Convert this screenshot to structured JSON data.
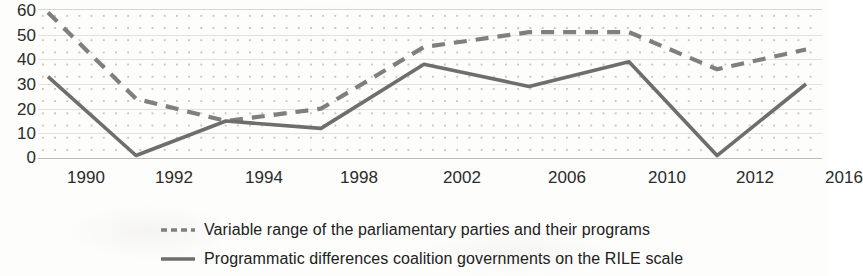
{
  "chart_data": {
    "type": "line",
    "title": "",
    "subtitle": "",
    "xlabel": "",
    "ylabel": "",
    "categories": [
      "1990",
      "1992",
      "1994",
      "1998",
      "2002",
      "2006",
      "2010",
      "2012",
      "2016"
    ],
    "x": [
      1990,
      1992,
      1994,
      1998,
      2002,
      2006,
      2010,
      2012,
      2016
    ],
    "ylim": [
      0,
      60
    ],
    "xlim_index": [
      0,
      8
    ],
    "y_ticks": [
      0,
      10,
      20,
      30,
      40,
      50,
      60
    ],
    "grid": "horizontal-light-with-dot-pattern-background",
    "legend_position": "bottom-center",
    "series": [
      {
        "name": "Variable range of the parliamentary parties and their programs",
        "style": "dashed",
        "color": "#7f7f7f",
        "values": [
          59,
          24,
          15,
          20,
          45,
          51,
          51,
          36,
          44
        ]
      },
      {
        "name": "Programmatic differences coalition governments on the RILE scale",
        "style": "solid",
        "color": "#6e6e6e",
        "values": [
          33,
          1,
          15,
          12,
          38,
          29,
          39,
          1,
          30
        ]
      }
    ]
  },
  "axes": {
    "y_tick_labels": [
      "60",
      "50",
      "40",
      "30",
      "20",
      "10",
      "0"
    ],
    "x_tick_labels": [
      "1990",
      "1992",
      "1994",
      "1998",
      "2002",
      "2006",
      "2010",
      "2012",
      "2016"
    ]
  },
  "legend": {
    "entries": [
      {
        "label": "Variable range of the parliamentary parties and their programs",
        "marker": "dashed-line-swatch",
        "color": "#7f7f7f"
      },
      {
        "label": "Programmatic differences coalition governments on the RILE scale",
        "marker": "solid-line-swatch",
        "color": "#6e6e6e"
      }
    ]
  },
  "colors": {
    "series_dashed": "#7f7f7f",
    "series_solid": "#6e6e6e",
    "text": "#2b2b2b",
    "grid": "#e3e1dd",
    "plot_background": "#fdfdfc",
    "dot_pattern": "#a88a8a"
  }
}
